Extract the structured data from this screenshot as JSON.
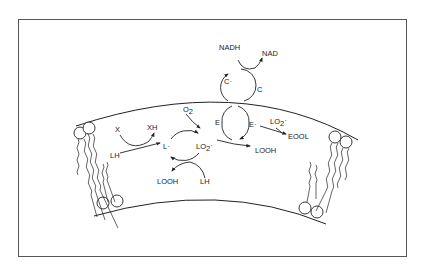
{
  "diagram": {
    "labels": {
      "x": "X",
      "xh": "XH",
      "lh_init": "LH",
      "l_radical": "L·",
      "o2": "O",
      "o2_sub": "2",
      "lo2_radical": "LO",
      "lo2_sub": "2",
      "lo2_dot": "·",
      "looh_bottom": "LOOH",
      "lh_bottom": "LH",
      "e": "E",
      "e_radical": "E·",
      "lo2_right": "LO",
      "lo2_right_sub": "2",
      "lo2_right_dot": "·",
      "eool": "EOOL",
      "looh_right": "LOOH",
      "nadh": "NADH",
      "nad": "NAD",
      "c_radical": "C·",
      "c": "C"
    },
    "nodes": [
      "X",
      "XH",
      "LH",
      "L·",
      "O2",
      "LO2·",
      "LOOH",
      "E",
      "E·",
      "EOOL",
      "C·",
      "C",
      "NADH",
      "NAD"
    ],
    "edges": [
      {
        "from": "LH",
        "to": "L·",
        "via": "X → XH"
      },
      {
        "from": "L·",
        "to": "LO2·",
        "via": "O2"
      },
      {
        "from": "LO2·",
        "to": "L·",
        "via": "LH → LOOH"
      },
      {
        "from": "LO2·",
        "to": "LOOH",
        "via": "E → E·"
      },
      {
        "from": "E·",
        "to": "EOOL",
        "via": "LO2·"
      },
      {
        "from": "E·",
        "to": "E",
        "via": "C· ← C"
      },
      {
        "from": "C·",
        "to": "C",
        "via": "NADH → NAD"
      }
    ]
  }
}
